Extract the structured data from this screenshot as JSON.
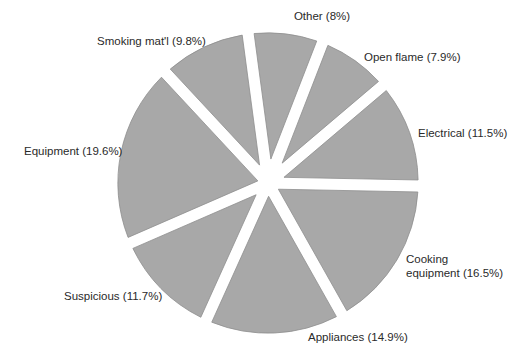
{
  "chart_data": {
    "type": "pie",
    "title": "",
    "start_angle_deg_from_top": -7.6,
    "direction": "clockwise",
    "exploded": true,
    "fill_color": "#a8a8a8",
    "stroke_color": "#8e8e8e",
    "label_color": "#2a2a2a",
    "slices": [
      {
        "name": "Other",
        "value": 8.0,
        "label_lines": [
          "Other (8%)"
        ]
      },
      {
        "name": "Open flame",
        "value": 7.9,
        "label_lines": [
          "Open flame (7.9%)"
        ]
      },
      {
        "name": "Electrical",
        "value": 11.5,
        "label_lines": [
          "Electrical (11.5%)"
        ]
      },
      {
        "name": "Cooking equipment",
        "value": 16.5,
        "label_lines": [
          "Cooking",
          "equipment (16.5%)"
        ]
      },
      {
        "name": "Appliances",
        "value": 14.9,
        "label_lines": [
          "Appliances (14.9%)"
        ]
      },
      {
        "name": "Suspicious",
        "value": 11.7,
        "label_lines": [
          "Suspicious (11.7%)"
        ]
      },
      {
        "name": "Equipment",
        "value": 19.6,
        "label_lines": [
          "Equipment (19.6%)"
        ]
      },
      {
        "name": "Smoking mat'l",
        "value": 9.8,
        "label_lines": [
          "Smoking mat'l (9.8%)"
        ]
      }
    ]
  }
}
